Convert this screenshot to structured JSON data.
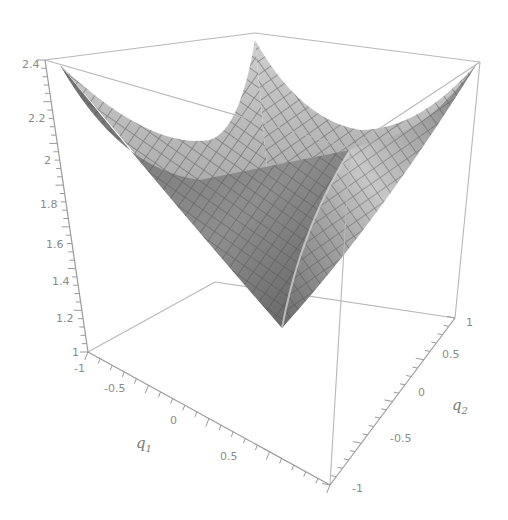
{
  "chart_data": {
    "type": "surface3d",
    "title": "",
    "function_description": "V-shaped (cone-like) surface with minimum at center q1=0,q2=0, z=1 rising to ~2.4 at the corners",
    "x": {
      "label": "q1",
      "range": [
        -1,
        1
      ],
      "ticks": [
        "-1",
        "-0.5",
        "0",
        "0.5"
      ]
    },
    "y": {
      "label": "q2",
      "range": [
        -1,
        1
      ],
      "ticks": [
        "-1",
        "-0.5",
        "0",
        "0.5",
        "1"
      ]
    },
    "z": {
      "label": "",
      "range": [
        1,
        2.4
      ],
      "ticks": [
        "1",
        "1.2",
        "1.4",
        "1.6",
        "1.8",
        "2",
        "2.2",
        "2.4"
      ]
    },
    "surface_samples": [
      {
        "q1": -1,
        "q2": -1,
        "z": 2.41
      },
      {
        "q1": -1,
        "q2": 1,
        "z": 2.41
      },
      {
        "q1": 1,
        "q2": -1,
        "z": 2.41
      },
      {
        "q1": 1,
        "q2": 1,
        "z": 2.41
      },
      {
        "q1": 0,
        "q2": 0,
        "z": 1.0
      },
      {
        "q1": -1,
        "q2": 0,
        "z": 2.0
      },
      {
        "q1": 1,
        "q2": 0,
        "z": 2.0
      },
      {
        "q1": 0,
        "q2": -1,
        "z": 2.0
      },
      {
        "q1": 0,
        "q2": 1,
        "z": 2.0
      }
    ],
    "grid_mesh": true,
    "box_frame": true,
    "color": "#8c8c8c"
  },
  "labels": {
    "z_ticks": [
      "2.4",
      "2.2",
      "2",
      "1.8",
      "1.6",
      "1.4",
      "1.2",
      "1"
    ],
    "q1_ticks": [
      "-1",
      "-0.5",
      "0",
      "0.5"
    ],
    "q2_ticks": [
      "-1",
      "-0.5",
      "0",
      "0.5",
      "1"
    ],
    "q1_title": "q",
    "q1_sub": "1",
    "q2_title": "q",
    "q2_sub": "2"
  }
}
